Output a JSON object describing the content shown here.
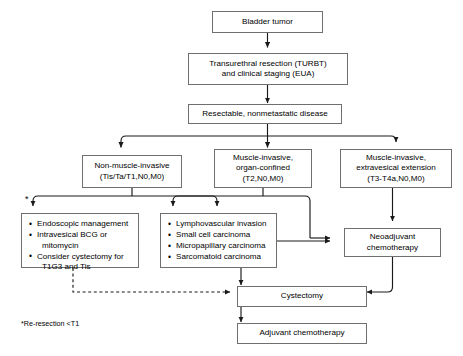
{
  "diagram": {
    "stroke_color": "#6f6f6f",
    "line_color": "#1a1a1a",
    "background": "#ffffff",
    "nodes": {
      "bladder_tumor": "Bladder tumor",
      "turbt_line1": "Transurethral resection (TURBT)",
      "turbt_line2": "and clinical staging (EUA)",
      "resectable": "Resectable, nonmetastatic disease",
      "nmibc_line1": "Non-muscle-invasive",
      "nmibc_line2": "(Tis/Ta/T1,N0,M0)",
      "mibc_organ_line1": "Muscle-invasive,",
      "mibc_organ_line2": "organ-confined",
      "mibc_organ_line3": "(T2,N0,M0)",
      "mibc_extra_line1": "Muscle-invasive,",
      "mibc_extra_line2": "extravesical extension",
      "mibc_extra_line3": "(T3-T4a,N0,M0)",
      "neoadjuvant_line1": "Neoadjuvant",
      "neoadjuvant_line2": "chemotherapy",
      "cystectomy": "Cystectomy",
      "adjuvant": "Adjuvant chemotherapy"
    },
    "nmibc_options": [
      {
        "text": "Endoscopic management",
        "cont": ""
      },
      {
        "text": "Intravesical BCG or",
        "cont": "mitomycin"
      },
      {
        "text": "Consider cystectomy for",
        "cont": "T1G3 and Tis"
      }
    ],
    "adverse_histology": [
      {
        "text": "Lymphovascular invasion",
        "cont": ""
      },
      {
        "text": "Small cell carcinoma",
        "cont": ""
      },
      {
        "text": "Micropapillary carcinoma",
        "cont": ""
      },
      {
        "text": "Sarcomatoid carcinoma",
        "cont": ""
      }
    ],
    "asterisk": "*",
    "footnote": "*Re-resection <T1"
  }
}
